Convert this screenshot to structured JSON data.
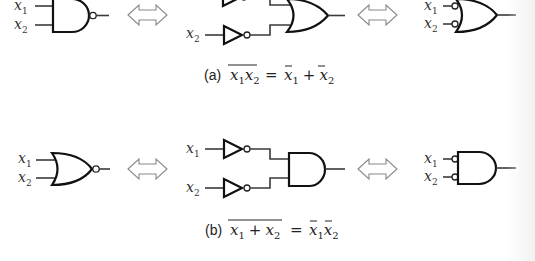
{
  "figure": {
    "parts": [
      {
        "id": "a",
        "label": "(a)",
        "left_gate": "NAND",
        "middle_circuit": "OR with inverted inputs (inverters)",
        "right_gate": "OR with bubbled inputs",
        "inputs": [
          "x1",
          "x2"
        ],
        "equation": {
          "lhs": "x1x2 (overlined)",
          "equals": "=",
          "rhs": "x̄1 + x̄2"
        }
      },
      {
        "id": "b",
        "label": "(b)",
        "left_gate": "NOR",
        "middle_circuit": "AND with inverted inputs (inverters)",
        "right_gate": "AND with bubbled inputs",
        "inputs": [
          "x1",
          "x2"
        ],
        "equation": {
          "lhs": "x1 + x2 (overlined)",
          "equals": "=",
          "rhs": "x̄1x̄2"
        }
      }
    ],
    "input_letter": "x",
    "sub1": "1",
    "sub2": "2",
    "cap_a_label": "(a)",
    "cap_b_label": "(b)",
    "plus": "+",
    "equals": "=",
    "equivalence_symbol": "double-headed-arrow",
    "colors": {
      "line": "#111111",
      "arrow": "#888888",
      "text": "#222222"
    }
  }
}
